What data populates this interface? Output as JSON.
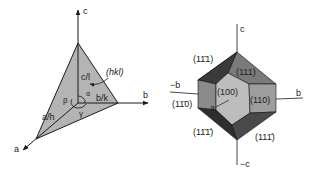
{
  "left_diagram": {
    "title": "Unit cell axes with plane (hkl)",
    "axis_labels": {
      "a": "a",
      "b": "b",
      "c": "c"
    },
    "intercepts": {
      "a": "a/h",
      "b": "b/k",
      "c": "c/l"
    },
    "plane_label": "(hkl)",
    "angles": {
      "alpha": "α",
      "beta": "β",
      "gamma": "γ"
    },
    "colors": {
      "plane": "#b4b4b4",
      "lines": "#1a1a1a"
    }
  },
  "right_diagram": {
    "title": "Crystal habit with indexed faces",
    "axis_labels": {
      "c": "c",
      "neg_c": "−c",
      "b": "b",
      "neg_b": "−b",
      "a": "a"
    },
    "faces": {
      "f100": "(100)",
      "f110": "(110)",
      "f1m10": "(1̄0)",
      "f111": "(111)",
      "f1m11": "(1̄11)",
      "f1m1m1": "(1̄1̄)",
      "f11m1": "(111̄)"
    },
    "face_labels": {
      "f100": "(100)",
      "f110": "(110)",
      "f1m10": "(11̄0)",
      "f111": "(111)",
      "f1m11": "(11̄1)",
      "f1m1m1": "(11̄1̄)",
      "f11m1": "(111̄)"
    },
    "colors": {
      "front": "#bdbdbd",
      "right": "#9e9e9e",
      "left": "#8a8a8a",
      "top_right": "#7a7a7a",
      "top_left": "#3a3a3a",
      "bottom_left": "#2e2e2e",
      "bottom_right": "#4a4a4a"
    }
  }
}
